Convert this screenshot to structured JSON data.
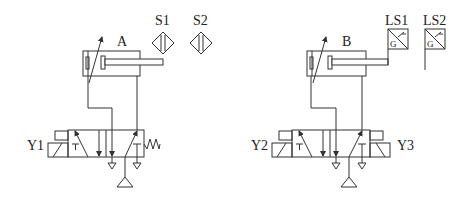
{
  "diagram": {
    "type": "pneumatic-circuit",
    "background": "#ffffff",
    "line_color": "#333333",
    "circuits": [
      {
        "id": "A",
        "cylinder_label": "A",
        "valve_label": "Y1",
        "valve_type": "5/2 single solenoid, spring return",
        "sensors": [
          {
            "label": "S1",
            "type": "proximity-sensor"
          },
          {
            "label": "S2",
            "type": "proximity-sensor"
          }
        ]
      },
      {
        "id": "B",
        "cylinder_label": "B",
        "valve_labels": [
          "Y2",
          "Y3"
        ],
        "valve_type": "5/2 double solenoid",
        "sensors": [
          {
            "label": "LS1",
            "type": "limit-switch",
            "inner_text": "G"
          },
          {
            "label": "LS2",
            "type": "limit-switch",
            "inner_text": "G"
          }
        ]
      }
    ]
  },
  "labels": {
    "A": "A",
    "B": "B",
    "S1": "S1",
    "S2": "S2",
    "LS1": "LS1",
    "LS2": "LS2",
    "Y1": "Y1",
    "Y2": "Y2",
    "Y3": "Y3",
    "G": "G"
  }
}
